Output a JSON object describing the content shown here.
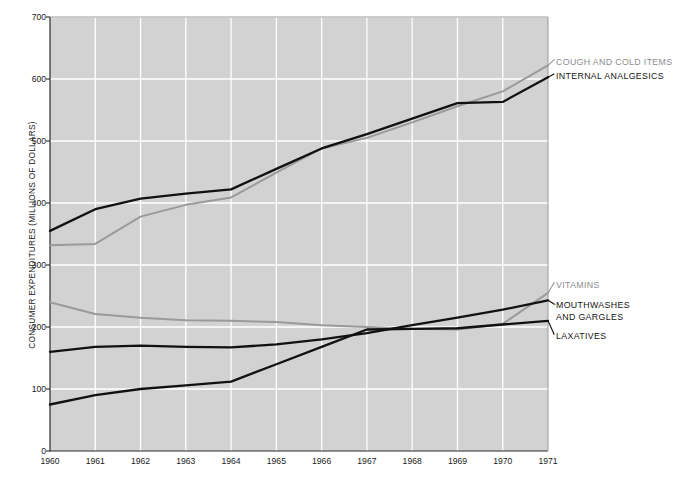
{
  "chart_data": {
    "type": "line",
    "title": "",
    "xlabel": "",
    "ylabel": "CONSUMER EXPENDITURES (MILLIONS OF DOLLARS)",
    "x": [
      1960,
      1961,
      1962,
      1963,
      1964,
      1965,
      1966,
      1967,
      1968,
      1969,
      1970,
      1971
    ],
    "xtick_labels": [
      "1960",
      "1961",
      "1962",
      "1963",
      "1964",
      "1965",
      "1966",
      "1967",
      "1968",
      "1969",
      "1970",
      "1971"
    ],
    "ytick_labels": [
      "0",
      "100",
      "200",
      "300",
      "400",
      "500",
      "600",
      "700"
    ],
    "ylim": [
      0,
      700
    ],
    "xlim": [
      1960,
      1971
    ],
    "grid": true,
    "legend_position": "right-inline-labels",
    "plot_background": "#d2d2d2",
    "gridline_color": "#ffffff",
    "series": [
      {
        "name": "COUGH AND COLD ITEMS",
        "color": "#9a9a9a",
        "label_color": "#8c8c8c",
        "values": [
          332,
          334,
          378,
          397,
          409,
          449,
          488,
          505,
          530,
          556,
          580,
          622
        ]
      },
      {
        "name": "INTERNAL ANALGESICS",
        "color": "#111111",
        "label_color": "#151515",
        "values": [
          355,
          390,
          407,
          415,
          422,
          455,
          488,
          511,
          536,
          561,
          563,
          603
        ]
      },
      {
        "name": "VITAMINS",
        "color": "#9a9a9a",
        "label_color": "#8c8c8c",
        "values": [
          240,
          221,
          215,
          211,
          210,
          208,
          203,
          200,
          197,
          196,
          205,
          255
        ]
      },
      {
        "name": "MOUTHWASHES AND GARGLES",
        "color": "#111111",
        "label_color": "#151515",
        "values": [
          160,
          168,
          170,
          168,
          167,
          172,
          180,
          190,
          203,
          215,
          228,
          243
        ]
      },
      {
        "name": "LAXATIVES",
        "color": "#111111",
        "label_color": "#151515",
        "values": [
          75,
          90,
          100,
          106,
          112,
          140,
          168,
          196,
          197,
          198,
          204,
          210
        ]
      }
    ]
  },
  "labels": {
    "cough_and_cold": "COUGH AND COLD ITEMS",
    "internal_analgesics": "INTERNAL ANALGESICS",
    "vitamins": "VITAMINS",
    "mouthwashes_line1": "MOUTHWASHES",
    "mouthwashes_line2": "AND GARGLES",
    "laxatives": "LAXATIVES"
  }
}
